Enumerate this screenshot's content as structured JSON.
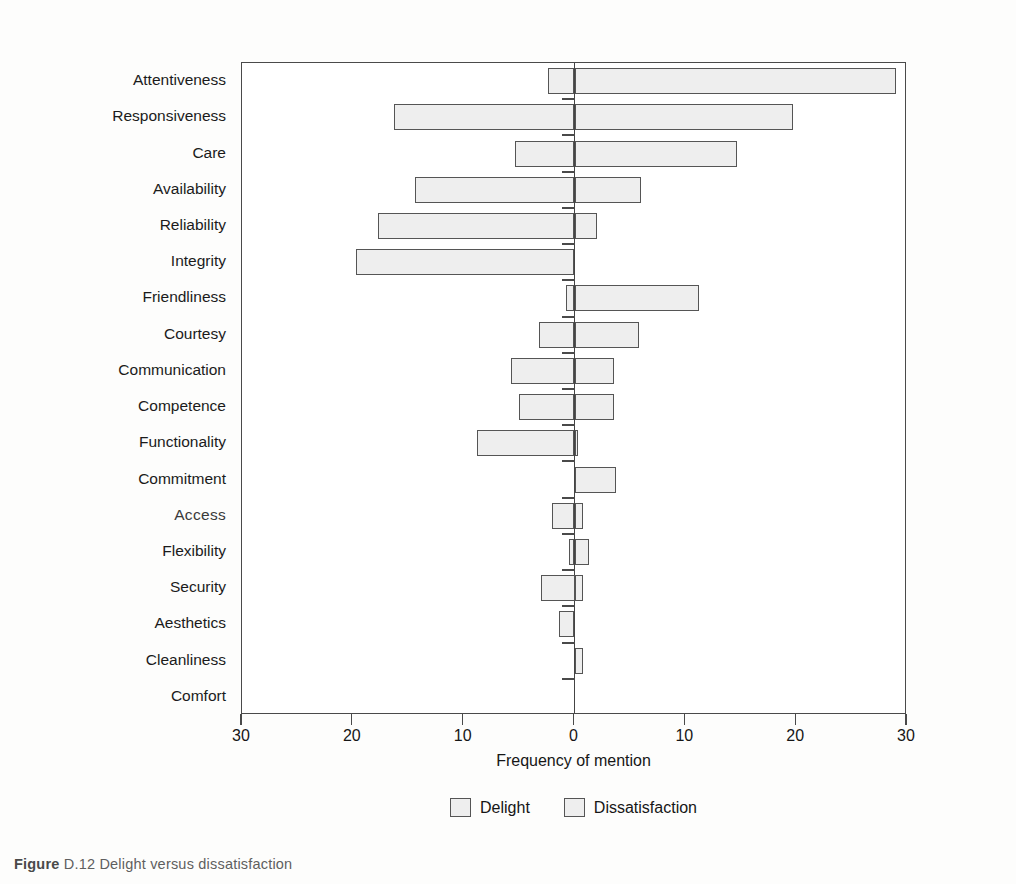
{
  "chart_data": {
    "type": "bar",
    "orientation": "horizontal",
    "style": "diverging-bidirectional",
    "title": "",
    "xlabel": "Frequency of mention",
    "ylabel": "",
    "xlim": [
      -30,
      30
    ],
    "xticks": [
      -30,
      -20,
      -10,
      0,
      10,
      20,
      30
    ],
    "xticklabels": [
      "30",
      "20",
      "10",
      "0",
      "10",
      "20",
      "30"
    ],
    "grid": false,
    "legend_position": "bottom-center",
    "legend": [
      {
        "name": "Delight",
        "side": "right",
        "note": "positive / right of zero"
      },
      {
        "name": "Dissatisfaction",
        "side": "left",
        "note": "negative / left of zero"
      }
    ],
    "categories": [
      "Attentiveness",
      "Responsiveness",
      "Care",
      "Availability",
      "Reliability",
      "Integrity",
      "Friendliness",
      "Courtesy",
      "Communication",
      "Competence",
      "Functionality",
      "Commitment",
      "Access",
      "Flexibility",
      "Security",
      "Aesthetics",
      "Cleanliness",
      "Comfort"
    ],
    "series": [
      {
        "name": "Delight",
        "values": [
          29,
          19.7,
          14.7,
          6,
          2,
          0,
          11.2,
          5.8,
          3.6,
          3.6,
          0.3,
          3.7,
          0.8,
          1.3,
          0.8,
          0,
          0.8,
          0
        ]
      },
      {
        "name": "Dissatisfaction",
        "values": [
          2.4,
          16.3,
          5.4,
          14.4,
          17.7,
          19.7,
          0.8,
          3.2,
          5.7,
          5,
          8.8,
          0,
          2,
          0.5,
          3,
          1.4,
          0,
          0
        ]
      }
    ]
  },
  "axis": {
    "xlabel": "Frequency of mention",
    "ticklabels": [
      "30",
      "20",
      "10",
      "0",
      "10",
      "20",
      "30"
    ]
  },
  "legend": {
    "delight_label": "Delight",
    "dissatisfaction_label": "Dissatisfaction"
  },
  "caption": {
    "prefix": "Figure",
    "rest": "D.12 Delight versus dissatisfaction"
  },
  "labels": {
    "items": [
      "Attentiveness",
      "Responsiveness",
      "Care",
      "Availability",
      "Reliability",
      "Integrity",
      "Friendliness",
      "Courtesy",
      "Communication",
      "Competence",
      "Functionality",
      "Commitment",
      "Access",
      "Flexibility",
      "Security",
      "Aesthetics",
      "Cleanliness",
      "Comfort"
    ]
  }
}
